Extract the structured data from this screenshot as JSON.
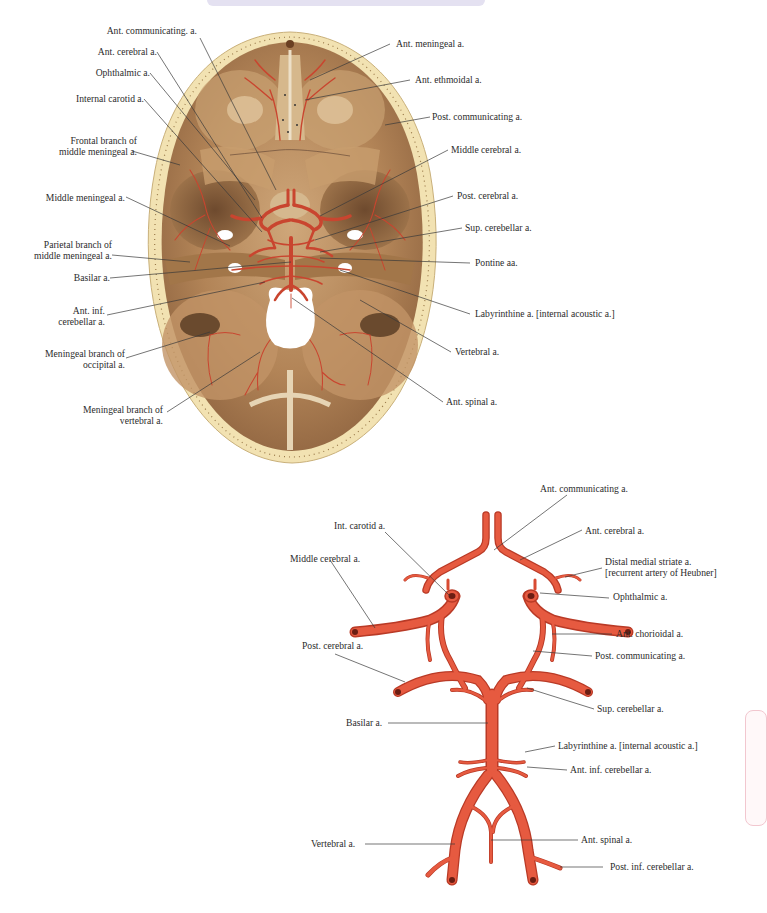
{
  "figure_top": {
    "title": "Arteries of the cranial base (superior view of skull base)",
    "colors": {
      "bone": "#b58a5c",
      "bone_rim": "#f0dfae",
      "artery": "#c9452f",
      "background": "#ffffff"
    },
    "labels_left": [
      {
        "id": "ant-communicating",
        "text": "Ant. communicating. a."
      },
      {
        "id": "ant-cerebral",
        "text": "Ant. cerebral a."
      },
      {
        "id": "ophthalmic",
        "text": "Ophthalmic a."
      },
      {
        "id": "internal-carotid",
        "text": "Internal carotid a."
      },
      {
        "id": "frontal-branch-mm",
        "line1": "Frontal branch of",
        "line2": "middle meningeal a."
      },
      {
        "id": "middle-meningeal",
        "text": "Middle meningeal a."
      },
      {
        "id": "parietal-branch-mm",
        "line1": "Parietal branch of",
        "line2": "middle meningeal a."
      },
      {
        "id": "basilar",
        "text": "Basilar a."
      },
      {
        "id": "ant-inf-cerebellar",
        "line1": "Ant. inf.",
        "line2": "cerebellar a."
      },
      {
        "id": "meningeal-branch-occipital",
        "line1": "Meningeal branch of",
        "line2": "occipital a."
      },
      {
        "id": "meningeal-branch-vertebral",
        "line1": "Meningeal branch of",
        "line2": "vertebral a."
      }
    ],
    "labels_right": [
      {
        "id": "ant-meningeal",
        "text": "Ant. meningeal a."
      },
      {
        "id": "ant-ethmoidal",
        "text": "Ant. ethmoidal a."
      },
      {
        "id": "post-communicating",
        "text": "Post. communicating a."
      },
      {
        "id": "middle-cerebral",
        "text": "Middle cerebral a."
      },
      {
        "id": "post-cerebral",
        "text": "Post. cerebral a."
      },
      {
        "id": "sup-cerebellar",
        "text": "Sup. cerebellar a."
      },
      {
        "id": "pontine",
        "text": "Pontine aa."
      },
      {
        "id": "labyrinthine",
        "text": "Labyrinthine a. [internal acoustic a.]"
      },
      {
        "id": "vertebral",
        "text": "Vertebral a."
      },
      {
        "id": "ant-spinal",
        "text": "Ant. spinal a."
      }
    ]
  },
  "figure_bottom": {
    "title": "Cerebral arterial circle (circle of Willis)",
    "colors": {
      "artery": "#e0523a",
      "artery_dark": "#b93a26",
      "lumen": "#6b1d12"
    },
    "labels": [
      {
        "id": "ant-communicating",
        "text": "Ant. communicating a."
      },
      {
        "id": "int-carotid",
        "text": "Int. carotid a."
      },
      {
        "id": "ant-cerebral",
        "text": "Ant. cerebral a."
      },
      {
        "id": "middle-cerebral",
        "text": "Middle cerebral a."
      },
      {
        "id": "distal-medial-striate",
        "line1": "Distal medial striate a.",
        "line2": "[recurrent artery of Heubner]"
      },
      {
        "id": "ophthalmic",
        "text": "Ophthalmic a."
      },
      {
        "id": "ant-chorioidal",
        "text": "Ant. chorioidal a."
      },
      {
        "id": "post-cerebral",
        "text": "Post. cerebral a."
      },
      {
        "id": "post-communicating",
        "text": "Post. communicating a."
      },
      {
        "id": "sup-cerebellar",
        "text": "Sup. cerebellar a."
      },
      {
        "id": "basilar",
        "text": "Basilar a."
      },
      {
        "id": "labyrinthine",
        "text": "Labyrinthine a. [internal acoustic a.]"
      },
      {
        "id": "ant-inf-cerebellar",
        "text": "Ant. inf. cerebellar a."
      },
      {
        "id": "vertebral",
        "text": "Vertebral a."
      },
      {
        "id": "ant-spinal",
        "text": "Ant. spinal a."
      },
      {
        "id": "post-inf-cerebellar",
        "text": "Post. inf. cerebellar a."
      }
    ]
  }
}
